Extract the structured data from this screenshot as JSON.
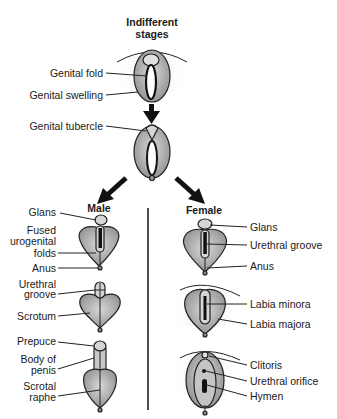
{
  "title": {
    "line1": "Indifferent",
    "line2": "stages"
  },
  "indifferent": {
    "labels": [
      "Genital fold",
      "Genital swelling",
      "Genital tubercle"
    ]
  },
  "male": {
    "heading": "Male",
    "stage1": {
      "labels": [
        "Glans",
        "Fused",
        "urogenital",
        "folds",
        "Anus"
      ]
    },
    "stage2": {
      "labels": [
        "Urethral",
        "groove",
        "Scrotum"
      ]
    },
    "stage3": {
      "labels": [
        "Prepuce",
        "Body of",
        "penis",
        "Scrotal",
        "raphe"
      ]
    }
  },
  "female": {
    "heading": "Female",
    "stage1": {
      "labels": [
        "Glans",
        "Urethral groove",
        "Anus"
      ]
    },
    "stage2": {
      "labels": [
        "Labia minora",
        "Labia majora"
      ]
    },
    "stage3": {
      "labels": [
        "Clitoris",
        "Urethral orifice",
        "Hymen"
      ]
    }
  },
  "colors": {
    "fill_gray": "#a9a9a9",
    "fill_light": "#d0d0d0",
    "stroke": "#222222",
    "text": "#1a1a1a"
  }
}
